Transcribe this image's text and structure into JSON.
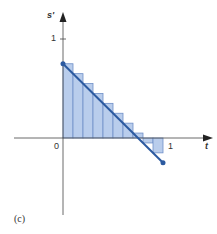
{
  "chart_data": {
    "type": "bar",
    "title": "",
    "caption": "(c)",
    "xlabel": "t",
    "ylabel": "s'",
    "xlim": [
      -0.5,
      1.2
    ],
    "ylim": [
      -1.0,
      1.2
    ],
    "x_ticks": [
      {
        "value": 0,
        "label": "0"
      },
      {
        "value": 1,
        "label": "1"
      }
    ],
    "y_ticks": [
      {
        "value": 1,
        "label": "1"
      }
    ],
    "grid": false,
    "legend": null,
    "line": {
      "name": "s'(t)",
      "x": [
        0,
        1
      ],
      "y": [
        0.75,
        -0.25
      ],
      "endpoints_marked": true
    },
    "riemann_bars": {
      "rule": "left-endpoint",
      "width": 0.1,
      "categories": [
        "0.0",
        "0.1",
        "0.2",
        "0.3",
        "0.4",
        "0.5",
        "0.6",
        "0.7",
        "0.8",
        "0.9"
      ],
      "values": [
        0.75,
        0.65,
        0.55,
        0.45,
        0.35,
        0.25,
        0.15,
        0.05,
        -0.05,
        -0.15
      ]
    },
    "colors": {
      "bar_fill": "#b9cdec",
      "bar_stroke": "#6f8fc8",
      "line": "#2c5aa0",
      "axis": "#444444"
    }
  },
  "labels": {
    "origin": "0",
    "x_tick_1": "1",
    "y_tick_1": "1",
    "x_axis": "t",
    "y_axis": "s'",
    "caption": "(c)"
  }
}
